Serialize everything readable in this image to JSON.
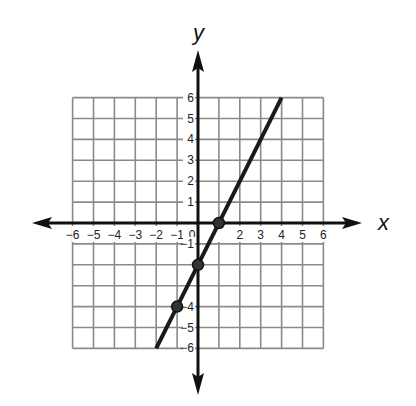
{
  "chart_data": {
    "type": "line",
    "title": "",
    "xlabel": "x",
    "ylabel": "y",
    "xlim": [
      -6,
      6
    ],
    "ylim": [
      -6,
      6
    ],
    "grid": true,
    "x_ticks": [
      -6,
      -5,
      -4,
      -3,
      -2,
      -1,
      0,
      2,
      3,
      4,
      5,
      6
    ],
    "y_ticks": [
      6,
      5,
      4,
      3,
      2,
      1,
      -1,
      -4,
      -5,
      -6
    ],
    "series": [
      {
        "name": "line",
        "equation": "y = 2x - 2",
        "x": [
          -2,
          4
        ],
        "y": [
          -6,
          6
        ]
      }
    ],
    "points": [
      {
        "x": -1,
        "y": -4
      },
      {
        "x": 0,
        "y": -2
      },
      {
        "x": 1,
        "y": 0
      }
    ],
    "colors": {
      "line": "#1a1a1a",
      "grid": "#8a8a8a",
      "axis": "#111111"
    }
  }
}
